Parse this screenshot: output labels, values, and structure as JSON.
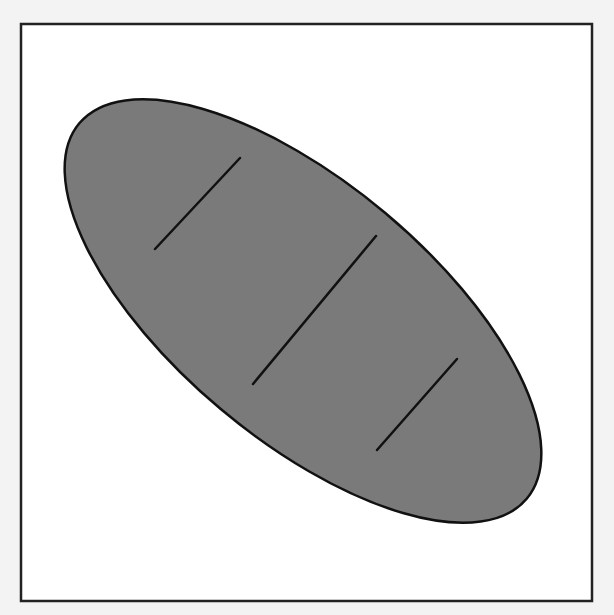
{
  "figure": {
    "icon": "bread-loaf-icon",
    "background_color": "#f3f3f3",
    "frame": {
      "x": 21,
      "y": 24,
      "width": 571,
      "height": 577,
      "fill": "#ffffff",
      "stroke": "#222222",
      "stroke_width": 2.5
    },
    "loaf": {
      "cx": 303,
      "cy": 311,
      "rx": 292,
      "ry": 128,
      "rotation_deg": 40,
      "fill": "#7a7a7a",
      "stroke": "#111111",
      "stroke_width": 2.5
    },
    "score_lines": [
      {
        "x1": 155,
        "y1": 249,
        "x2": 240,
        "y2": 158
      },
      {
        "x1": 253,
        "y1": 384,
        "x2": 376,
        "y2": 236
      },
      {
        "x1": 377,
        "y1": 450,
        "x2": 457,
        "y2": 359
      }
    ],
    "score_line_color": "#111111",
    "score_line_width": 2.5
  }
}
